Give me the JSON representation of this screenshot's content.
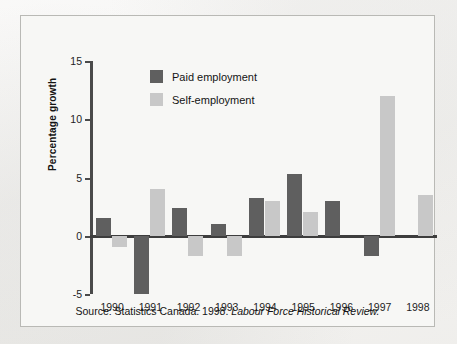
{
  "chart_data": {
    "type": "bar",
    "title": "",
    "xlabel": "",
    "ylabel": "Percentage growth",
    "categories": [
      "1990",
      "1991",
      "1992",
      "1993",
      "1994",
      "1995",
      "1996",
      "1997",
      "1998"
    ],
    "series": [
      {
        "name": "Paid employment",
        "color": "#5f5f5f",
        "values": [
          1.5,
          -5.0,
          2.4,
          1.0,
          3.2,
          5.3,
          3.0,
          -1.7,
          0
        ]
      },
      {
        "name": "Self-employment",
        "color": "#c8c8c8",
        "values": [
          -1.0,
          4.0,
          -1.7,
          -1.7,
          3.0,
          2.0,
          0,
          12.0,
          3.5
        ]
      }
    ],
    "ylim": [
      -5,
      15
    ],
    "yticks": [
      15,
      10,
      5,
      0,
      -5
    ],
    "ytick_labels": [
      "15",
      "10",
      "5",
      "0",
      "-5"
    ],
    "grid": false,
    "legend_position": "top-left-inside",
    "zero_line": true
  },
  "legend": {
    "items": [
      {
        "label": "Paid employment",
        "color": "#5f5f5f"
      },
      {
        "label": "Self-employment",
        "color": "#c8c8c8"
      }
    ]
  },
  "caption": {
    "source_prefix": "Source: Statistics Canada. 1998.",
    "publication": "Labour Force Historical Review."
  }
}
